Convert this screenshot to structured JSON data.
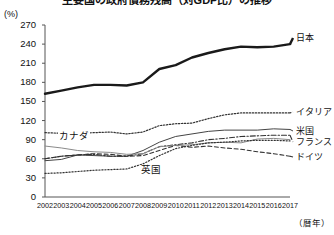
{
  "chart_title": "主要国の政府債務残高（対GDP比）の推移",
  "unit_label": "(%)",
  "xaxis_unit": "（暦年）",
  "inline_labels": [
    {
      "name": "canada",
      "text": "カナダ",
      "x": 58,
      "y": 136
    },
    {
      "name": "uk",
      "text": "英国",
      "x": 140,
      "y": 170
    }
  ],
  "right_labels": [
    {
      "name": "japan",
      "text": "日本",
      "x": 296,
      "y": 38
    },
    {
      "name": "italy",
      "text": "イタリア",
      "x": 296,
      "y": 112
    },
    {
      "name": "usa",
      "text": "米国",
      "x": 296,
      "y": 131
    },
    {
      "name": "france",
      "text": "フランス",
      "x": 296,
      "y": 142
    },
    {
      "name": "germany",
      "text": "ドイツ",
      "x": 296,
      "y": 157
    }
  ],
  "chart_data": {
    "type": "line",
    "title": "主要国の政府債務残高（対GDP比）の推移",
    "xlabel": "（暦年）",
    "ylabel": "(%)",
    "ylim": [
      0,
      270
    ],
    "ytick_step": 30,
    "yticks": [
      0,
      30,
      60,
      90,
      120,
      150,
      180,
      210,
      240,
      270
    ],
    "grid": false,
    "legend_position": "right-inline",
    "categories": [
      "2002",
      "2003",
      "2004",
      "2005",
      "2006",
      "2007",
      "2008",
      "2009",
      "2010",
      "2011",
      "2012",
      "2013",
      "2014",
      "2015",
      "2016",
      "2017"
    ],
    "series": [
      {
        "name": "日本",
        "style": "solid-thick",
        "color": "#1a1a1a",
        "values": [
          162,
          167,
          172,
          176,
          176,
          175,
          180,
          201,
          207,
          219,
          226,
          232,
          236,
          235,
          236,
          240
        ]
      },
      {
        "name": "イタリア",
        "style": "dotted",
        "color": "#333333",
        "values": [
          101,
          100,
          100,
          101,
          102,
          99,
          102,
          112,
          115,
          116,
          123,
          129,
          132,
          132,
          132,
          132
        ]
      },
      {
        "name": "米国",
        "style": "solid-thin",
        "color": "#444444",
        "values": [
          57,
          59,
          66,
          65,
          64,
          64,
          73,
          86,
          95,
          99,
          103,
          105,
          105,
          105,
          107,
          106
        ]
      },
      {
        "name": "フランス",
        "style": "dash-dot",
        "color": "#333333",
        "values": [
          60,
          64,
          66,
          67,
          64,
          64,
          68,
          79,
          82,
          85,
          90,
          92,
          95,
          96,
          97,
          97
        ]
      },
      {
        "name": "ドイツ",
        "style": "dashed",
        "color": "#333333",
        "values": [
          60,
          64,
          66,
          68,
          67,
          64,
          65,
          73,
          81,
          78,
          80,
          77,
          75,
          71,
          68,
          64
        ]
      },
      {
        "name": "カナダ",
        "style": "solid-gray",
        "color": "#8a8a8a",
        "values": [
          80,
          77,
          73,
          71,
          70,
          67,
          68,
          79,
          81,
          82,
          85,
          86,
          85,
          91,
          92,
          90
        ]
      },
      {
        "name": "英国",
        "style": "fine-dotted",
        "color": "#333333",
        "values": [
          37,
          38,
          40,
          42,
          43,
          44,
          52,
          65,
          76,
          81,
          85,
          86,
          88,
          89,
          89,
          88
        ]
      }
    ]
  }
}
